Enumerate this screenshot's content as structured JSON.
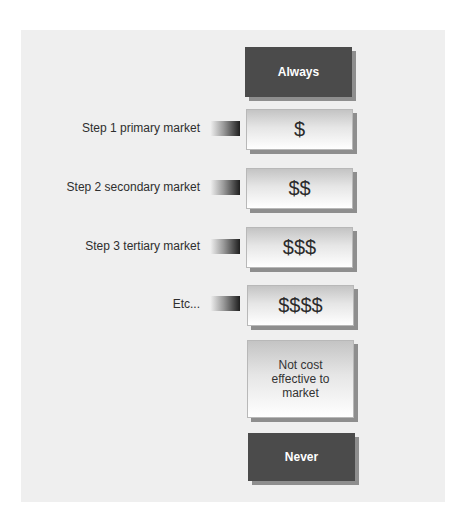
{
  "diagram": {
    "type": "market-rollout-cost-ladder",
    "top_box": {
      "label": "Always"
    },
    "steps": [
      {
        "label": "Step 1 primary market",
        "cost": "$"
      },
      {
        "label": "Step 2 secondary market",
        "cost": "$$"
      },
      {
        "label": "Step 3 tertiary market",
        "cost": "$$$"
      },
      {
        "label": "Etc...",
        "cost": "$$$$"
      }
    ],
    "threshold_box": {
      "label": "Not cost effective to market"
    },
    "bottom_box": {
      "label": "Never"
    },
    "colors": {
      "panel_background": "#efefef",
      "dark_box": "#4b4b4b",
      "dark_box_text": "#ffffff",
      "light_box_top": "#c4c4c4",
      "light_box_bottom": "#ffffff",
      "shadow": "#8e8e8e",
      "connector_start": "#f2f2f2",
      "connector_end": "#1e1e1e"
    }
  }
}
